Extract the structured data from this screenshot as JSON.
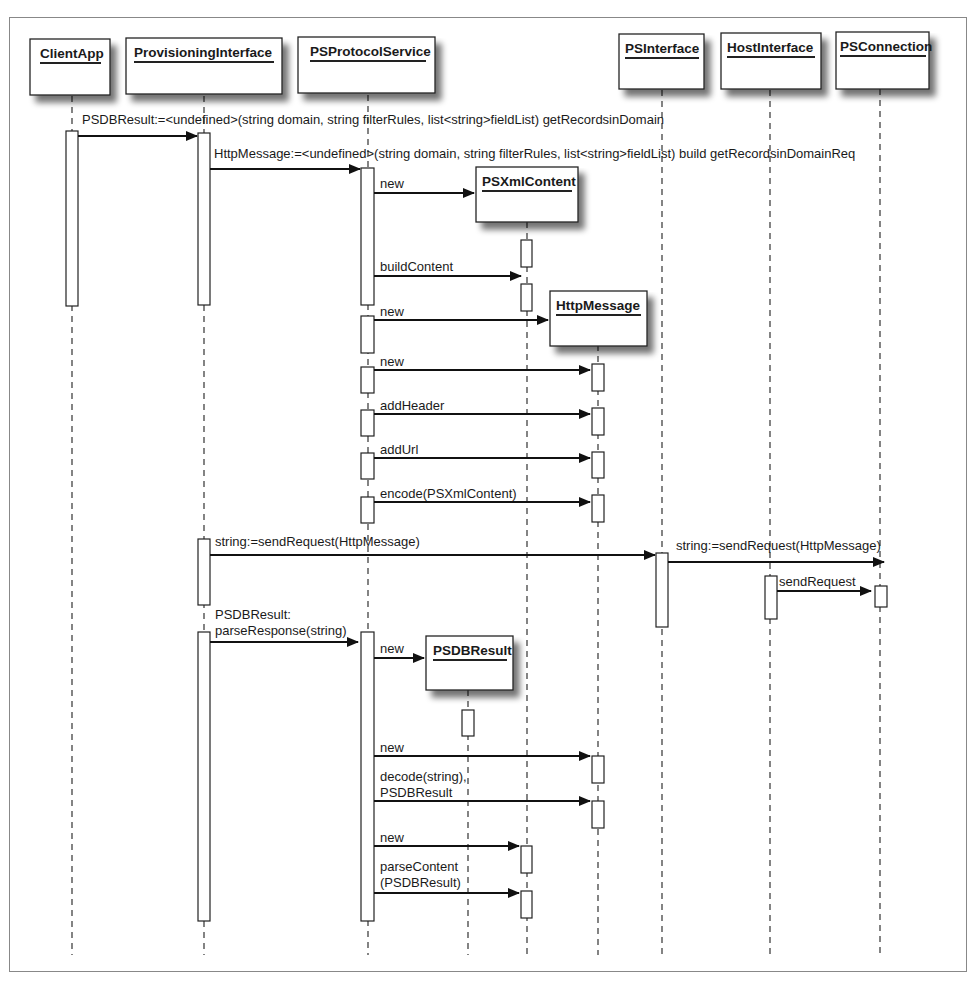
{
  "diagram": {
    "type": "uml-sequence-diagram",
    "participants": [
      {
        "id": "ClientApp",
        "label": "ClientApp",
        "x": 72
      },
      {
        "id": "ProvisioningInterface",
        "label": "ProvisioningInterface",
        "x": 204
      },
      {
        "id": "PSProtocolService",
        "label": "PSProtocolService",
        "x": 368
      },
      {
        "id": "PSXmlContent",
        "label": "PSXmlContent",
        "x": 527,
        "created": true
      },
      {
        "id": "HttpMessage",
        "label": "HttpMessage",
        "x": 598,
        "created": true
      },
      {
        "id": "PSDBResult",
        "label": "PSDBResult",
        "x": 468,
        "created": true
      },
      {
        "id": "PSInterface",
        "label": "PSInterface",
        "x": 662
      },
      {
        "id": "HostInterface",
        "label": "HostInterface",
        "x": 770
      },
      {
        "id": "PSConnection",
        "label": "PSConnection",
        "x": 880
      }
    ],
    "messages": [
      {
        "from": "ClientApp",
        "to": "ProvisioningInterface",
        "label": "PSDBResult:=<undefined>(string domain, string filterRules, list<string>fieldList) getRecordsinDomain"
      },
      {
        "from": "ProvisioningInterface",
        "to": "PSProtocolService",
        "label": "HttpMessage:=<undefined>(string domain, string filterRules, list<string>fieldList) build getRecordsinDomainReq"
      },
      {
        "from": "PSProtocolService",
        "to": "PSXmlContent",
        "label": "new"
      },
      {
        "from": "PSProtocolService",
        "to": "PSXmlContent",
        "label": "buildContent"
      },
      {
        "from": "PSProtocolService",
        "to": "HttpMessage",
        "label": "new"
      },
      {
        "from": "PSProtocolService",
        "to": "HttpMessage",
        "label": "new"
      },
      {
        "from": "PSProtocolService",
        "to": "HttpMessage",
        "label": "addHeader"
      },
      {
        "from": "PSProtocolService",
        "to": "HttpMessage",
        "label": "addUrl"
      },
      {
        "from": "PSProtocolService",
        "to": "HttpMessage",
        "label": "encode(PSXmlContent)"
      },
      {
        "from": "ProvisioningInterface",
        "to": "PSInterface",
        "label": "string:=sendRequest(HttpMessage)"
      },
      {
        "from": "PSInterface",
        "to": "PSConnection",
        "label": "string:=sendRequest(HttpMessage)"
      },
      {
        "from": "HostInterface",
        "to": "PSConnection",
        "label": "sendRequest"
      },
      {
        "from": "ProvisioningInterface",
        "to": "PSProtocolService",
        "label_line1": "PSDBResult:",
        "label_line2": "parseResponse(string)"
      },
      {
        "from": "PSProtocolService",
        "to": "PSDBResult",
        "label": "new"
      },
      {
        "from": "PSProtocolService",
        "to": "HttpMessage",
        "label": "new"
      },
      {
        "from": "PSProtocolService",
        "to": "HttpMessage",
        "label_line1": "decode(string),",
        "label_line2": "PSDBResult"
      },
      {
        "from": "PSProtocolService",
        "to": "PSXmlContent",
        "label": "new"
      },
      {
        "from": "PSProtocolService",
        "to": "PSXmlContent",
        "label_line1": "parseContent",
        "label_line2": "(PSDBResult)"
      }
    ]
  }
}
